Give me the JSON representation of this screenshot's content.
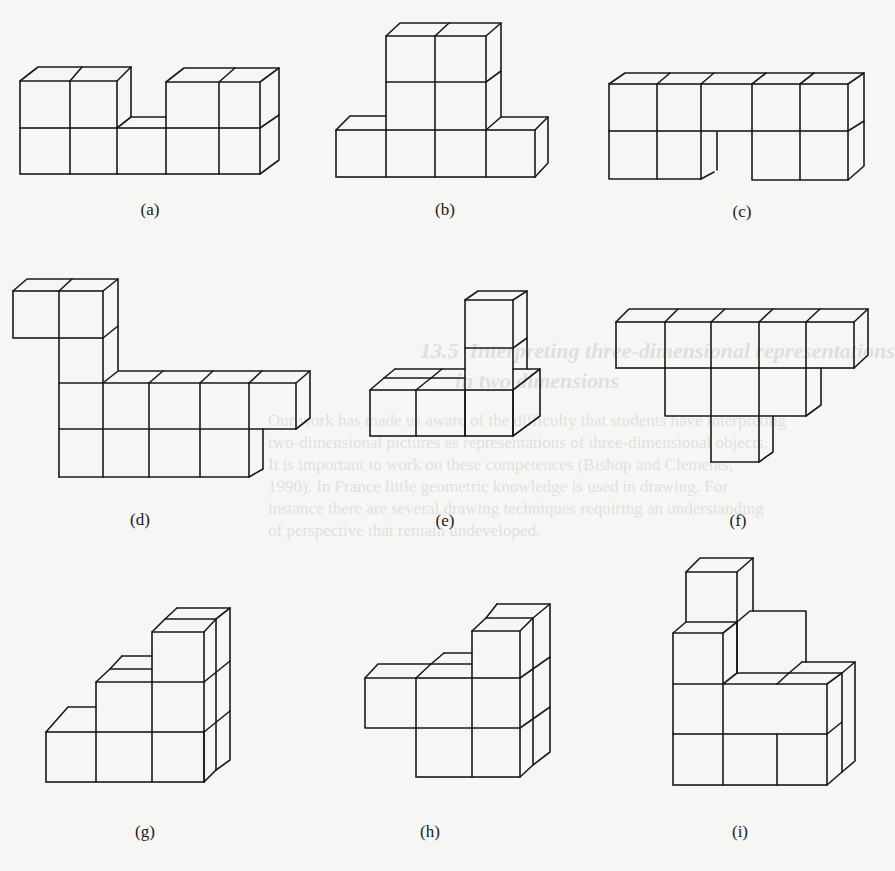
{
  "figure": {
    "captions": {
      "a": "(a)",
      "b": "(b)",
      "c": "(c)",
      "d": "(d)",
      "e": "(e)",
      "f": "(f)",
      "g": "(g)",
      "h": "(h)",
      "i": "(i)"
    }
  },
  "bleed_through": {
    "heading_line1": "13.5  Interpreting three-dimensional representations",
    "heading_line2": "in two dimensions",
    "body_lines": [
      "Our work has made us aware of the difficulty that students have interpreting",
      "two-dimensional pictures as representations of three-dimensional objects.",
      "It is important to work on these competences (Bishop and Clements,",
      "1990). In France little geometric knowledge is used in drawing. For",
      "instance there are several drawing techniques requiring an understanding",
      "of perspective that remain undeveloped."
    ]
  },
  "colors": {
    "paper": "#f6f6f4",
    "ink": "#1a1a1a"
  }
}
